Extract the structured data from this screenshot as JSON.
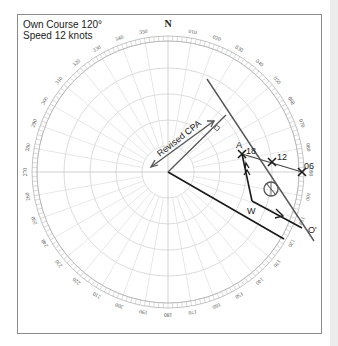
{
  "caption": {
    "line1": "Own Course 120°",
    "line2": "Speed 12 knots"
  },
  "compass": {
    "north_label": "N",
    "bearing_labels": [
      "010",
      "020",
      "030",
      "040",
      "050",
      "060",
      "070",
      "080",
      "090",
      "100",
      "110",
      "120",
      "130",
      "140",
      "150",
      "160",
      "170",
      "180",
      "190",
      "200",
      "210",
      "220",
      "230",
      "240",
      "250",
      "260",
      "270",
      "280",
      "290",
      "300",
      "310",
      "320",
      "330",
      "340",
      "350"
    ]
  },
  "plot": {
    "revised_cpa_label": "Revised CPA",
    "points": {
      "A": {
        "label": "A",
        "time": "18"
      },
      "p12": {
        "label": "12"
      },
      "p06": {
        "label": "06"
      },
      "W": {
        "label": "W"
      },
      "O_prime": {
        "label": "O'"
      }
    },
    "colors": {
      "own_track": "#1a1a1a",
      "relative_motion": "#555555",
      "grid": "#cfcfcf"
    }
  }
}
